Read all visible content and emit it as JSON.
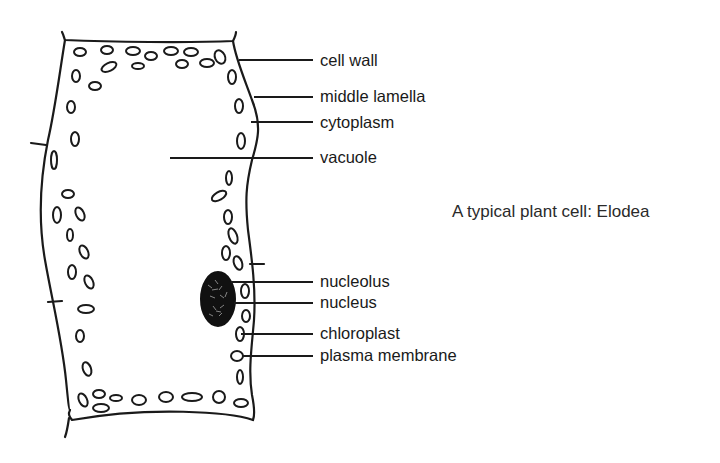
{
  "diagram": {
    "title": "A typical plant cell: Elodea",
    "labels": [
      {
        "id": "cell-wall",
        "text": "cell wall",
        "y": 60
      },
      {
        "id": "middle-lamella",
        "text": "middle lamella",
        "y": 96
      },
      {
        "id": "cytoplasm",
        "text": "cytoplasm",
        "y": 122
      },
      {
        "id": "vacuole",
        "text": "vacuole",
        "y": 158
      },
      {
        "id": "nucleolus",
        "text": "nucleolus",
        "y": 283
      },
      {
        "id": "nucleus",
        "text": "nucleus",
        "y": 303
      },
      {
        "id": "chloroplast",
        "text": "chloroplast",
        "y": 334
      },
      {
        "id": "plasma-membrane",
        "text": "plasma membrane",
        "y": 356
      }
    ],
    "colors": {
      "ink": "#1a1a1a",
      "background": "#ffffff"
    }
  }
}
